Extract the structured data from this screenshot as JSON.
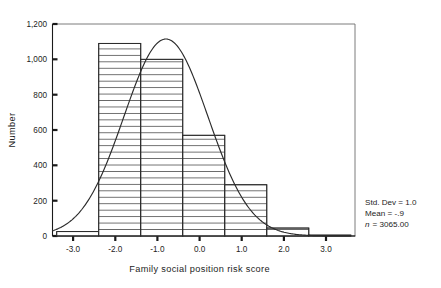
{
  "chart_data": {
    "type": "bar",
    "title": "",
    "subtitle": "",
    "xlabel": "Family social position risk score",
    "ylabel": "Number",
    "xlim": [
      -3.6,
      3.6
    ],
    "ylim": [
      0,
      1200
    ],
    "grid": false,
    "legend_position": "none",
    "bin_width": 1.0,
    "bin_edges": [
      -3.5,
      -2.5,
      -1.5,
      -0.5,
      0.5,
      1.5,
      2.5,
      3.5
    ],
    "categories": [
      "-3.0",
      "-2.0",
      "-1.0",
      "0.0",
      "1.0",
      "2.0",
      "3.0"
    ],
    "values": [
      25,
      1090,
      1000,
      570,
      290,
      45,
      5
    ],
    "bars": [
      {
        "center": -3.0,
        "left": -3.5,
        "right": -2.5,
        "value": 25
      },
      {
        "center": -2.0,
        "left": -2.5,
        "right": -1.5,
        "value": 1090
      },
      {
        "center": -1.0,
        "left": -1.5,
        "right": -0.5,
        "value": 1000
      },
      {
        "center": 0.0,
        "left": -0.5,
        "right": 0.5,
        "value": 570
      },
      {
        "center": 1.0,
        "left": 0.5,
        "right": 1.5,
        "value": 290
      },
      {
        "center": 2.0,
        "left": 1.5,
        "right": 2.5,
        "value": 45
      },
      {
        "center": 3.0,
        "left": 2.5,
        "right": 3.5,
        "value": 5
      }
    ],
    "overlay_curve": {
      "name": "normal curve",
      "type": "line",
      "mean": -0.9,
      "std_dev": 1.0,
      "n": 3065,
      "peak_value": 1115
    },
    "xticks": [
      -3.0,
      -2.0,
      -1.0,
      0.0,
      1.0,
      2.0,
      3.0
    ],
    "xtick_labels": [
      "-3.0",
      "-2.0",
      "-1.0",
      "0.0",
      "1.0",
      "2.0",
      "3.0"
    ],
    "yticks": [
      0,
      200,
      400,
      600,
      800,
      1000,
      1200
    ],
    "ytick_labels": [
      "0",
      "200",
      "400",
      "600",
      "800",
      "1,000",
      "1,200"
    ]
  },
  "axes": {
    "y_title": "Number",
    "x_title": "Family social position risk score",
    "y_labels": [
      "1,200",
      "1,000",
      "800",
      "600",
      "400",
      "200",
      "0"
    ],
    "x_labels": [
      "-3.0",
      "-2.0",
      "-1.0",
      "0.0",
      "1.0",
      "2.0",
      "3.0"
    ]
  },
  "stats_box": {
    "std_dev_line": "Std. Dev = 1.0",
    "mean_line": "Mean = -.9",
    "n_label": "n",
    "n_value": "= 3065.00",
    "std_dev_value": "1.0",
    "mean_value": "-.9",
    "n_count": "3065.00"
  }
}
